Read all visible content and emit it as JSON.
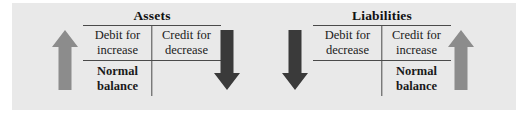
{
  "figure": {
    "background_color": "#ffffff",
    "panel_color": "#e9e9e9"
  },
  "colors": {
    "arrow_increase": "#8c8c8c",
    "arrow_decrease": "#3a3a3a",
    "rule": "#4a4a4a",
    "text": "#1a1a1a"
  },
  "accounts": [
    {
      "title": "Assets",
      "debit_label": "Debit for\nincrease",
      "debit_line1": "Debit for",
      "debit_line2": "increase",
      "credit_line1": "Credit for",
      "credit_line2": "decrease",
      "normal_balance_side": "debit",
      "normal_line1": "Normal",
      "normal_line2": "balance",
      "normal_empty": ""
    },
    {
      "title": "Liabilities",
      "debit_label": "Debit for\ndecrease",
      "debit_line1": "Debit for",
      "debit_line2": "decrease",
      "credit_line1": "Credit for",
      "credit_line2": "increase",
      "normal_balance_side": "credit",
      "normal_line1": "Normal",
      "normal_line2": "balance",
      "normal_empty": ""
    }
  ],
  "arrows": [
    {
      "name": "assets-increase-arrow",
      "direction": "up",
      "color": "#8c8c8c",
      "meaning": "increase"
    },
    {
      "name": "assets-decrease-arrow",
      "direction": "down",
      "color": "#3a3a3a",
      "meaning": "decrease"
    },
    {
      "name": "liabilities-decrease-arrow",
      "direction": "down",
      "color": "#3a3a3a",
      "meaning": "decrease"
    },
    {
      "name": "liabilities-increase-arrow",
      "direction": "up",
      "color": "#8c8c8c",
      "meaning": "increase"
    }
  ]
}
